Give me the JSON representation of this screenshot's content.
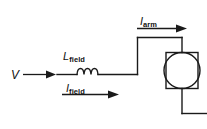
{
  "diagram": {
    "type": "electrical-circuit-schematic",
    "background_color": "#ffffff",
    "line_color": "#1a1a1a",
    "labels": {
      "source_voltage": {
        "symbol": "V",
        "subscript": ""
      },
      "field_inductance": {
        "symbol": "L",
        "subscript": "field"
      },
      "field_current": {
        "symbol": "I",
        "subscript": "field"
      },
      "armature_current": {
        "symbol": "I",
        "subscript": "arm"
      }
    },
    "components": [
      {
        "name": "voltage-source-terminal",
        "kind": "terminal",
        "label": "V"
      },
      {
        "name": "field-inductor",
        "kind": "inductor",
        "label": "L field",
        "coil_loops": 3
      },
      {
        "name": "motor",
        "kind": "dc-motor",
        "label": "",
        "shape": "circle-in-rectangle"
      }
    ],
    "current_arrows": [
      {
        "name": "source-current-arrow",
        "label": "",
        "direction": "right"
      },
      {
        "name": "field-current-arrow",
        "label": "I field",
        "direction": "right"
      },
      {
        "name": "armature-current-arrow",
        "label": "I arm",
        "direction": "right"
      }
    ]
  }
}
